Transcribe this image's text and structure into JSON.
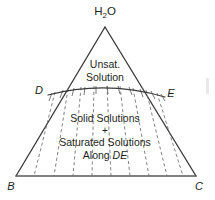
{
  "figure": {
    "kind": "ternary-phase-diagram",
    "background_color": "#ffffff",
    "line_color": "#3b3b3b",
    "tie_line_color": "#6d6d6d",
    "text_color": "#231f20"
  },
  "vertices": {
    "apex": {
      "label_main": "H",
      "label_sub": "2",
      "label_tail": "O",
      "label_full": "H2O",
      "x": 105,
      "y": 27,
      "label_x": 105,
      "label_y": 15
    },
    "bottom_left": {
      "label": "B",
      "x": 16,
      "y": 176,
      "label_x": 11,
      "label_y": 190
    },
    "bottom_right": {
      "label": "C",
      "x": 196,
      "y": 176,
      "label_x": 199,
      "label_y": 190
    }
  },
  "curve": {
    "name": "solidus-curve-DE",
    "start_label": "D",
    "end_label": "E",
    "start": {
      "x": 48,
      "y": 95,
      "label_x": 39,
      "label_y": 94
    },
    "end": {
      "x": 165,
      "y": 97,
      "label_x": 171,
      "label_y": 97
    },
    "apex_of_arc": {
      "x": 106,
      "y": 86
    }
  },
  "fields": {
    "upper": {
      "name": "unsaturated-solution-field",
      "lines": [
        "Unsat.",
        "Solution"
      ],
      "x": 105,
      "y_first": 68
    },
    "lower": {
      "name": "solid-plus-saturated-field",
      "line1": "Solid Solutions",
      "line2": "+",
      "line3": "Saturated Solutions",
      "line4_prefix": "Along ",
      "line4_italic": "DE",
      "x": 105,
      "y_first": 122
    }
  },
  "tie_lines": {
    "count": 9,
    "description": "dashed tie lines fanning from the DE solidus curve down to the BC base"
  },
  "hatch_ticks": {
    "count": 11,
    "description": "short tick marks hanging below the DE curve"
  }
}
